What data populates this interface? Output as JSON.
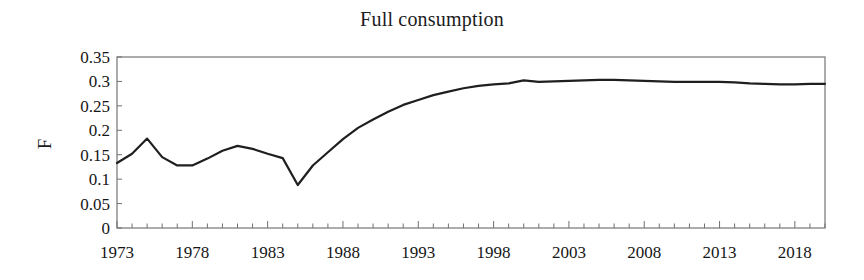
{
  "chart_data": {
    "type": "line",
    "title": "Full consumption",
    "xlabel": "",
    "ylabel": "F",
    "xlim": [
      1973,
      2020
    ],
    "ylim": [
      0,
      0.35
    ],
    "grid": false,
    "legend": null,
    "y_ticks": [
      "0.35",
      "0.3",
      "0.25",
      "0.2",
      "0.15",
      "0.1",
      "0.05",
      "0"
    ],
    "y_tick_values": [
      0.35,
      0.3,
      0.25,
      0.2,
      0.15,
      0.1,
      0.05,
      0
    ],
    "x_ticks": [
      "1973",
      "1978",
      "1983",
      "1988",
      "1993",
      "1998",
      "2003",
      "2008",
      "2013",
      "2018"
    ],
    "x_tick_values": [
      1973,
      1978,
      1983,
      1988,
      1993,
      1998,
      2003,
      2008,
      2013,
      2018
    ],
    "x_minor_tick_interval": 1,
    "line_color": "#1f1f1f",
    "line_width": 2.2,
    "series": [
      {
        "name": "F",
        "x": [
          1973,
          1974,
          1975,
          1976,
          1977,
          1978,
          1979,
          1980,
          1981,
          1982,
          1983,
          1984,
          1985,
          1986,
          1987,
          1988,
          1989,
          1990,
          1991,
          1992,
          1993,
          1994,
          1995,
          1996,
          1997,
          1998,
          1999,
          2000,
          2001,
          2002,
          2003,
          2004,
          2005,
          2006,
          2007,
          2008,
          2009,
          2010,
          2011,
          2012,
          2013,
          2014,
          2015,
          2016,
          2017,
          2018,
          2019,
          2020
        ],
        "values": [
          0.133,
          0.152,
          0.183,
          0.145,
          0.128,
          0.128,
          0.142,
          0.158,
          0.168,
          0.162,
          0.152,
          0.143,
          0.088,
          0.128,
          0.155,
          0.182,
          0.205,
          0.222,
          0.238,
          0.252,
          0.262,
          0.272,
          0.279,
          0.286,
          0.291,
          0.294,
          0.296,
          0.302,
          0.299,
          0.3,
          0.301,
          0.302,
          0.303,
          0.303,
          0.302,
          0.301,
          0.3,
          0.299,
          0.299,
          0.299,
          0.299,
          0.298,
          0.296,
          0.295,
          0.294,
          0.294,
          0.295,
          0.295
        ]
      }
    ]
  },
  "axes": {
    "border_color": "#808080",
    "tick_color": "#707070"
  }
}
